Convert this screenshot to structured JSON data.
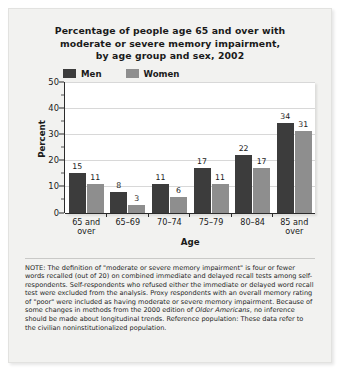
{
  "title": {
    "line1": "Percentage of people age 65 and over with",
    "line2": "moderate or severe memory impairment,",
    "line3": "by age group and sex, 2002"
  },
  "legend": {
    "men_label": "Men",
    "women_label": "Women",
    "men_color": "#3c3c3c",
    "women_color": "#8e8e8e"
  },
  "axes": {
    "ylabel": "Percent",
    "xlabel": "Age",
    "yticks": [
      "0",
      "10",
      "20",
      "30",
      "40",
      "50"
    ]
  },
  "note": {
    "part1": "NOTE: The definition of \"moderate or severe memory impairment\" is four or fewer words recalled (out of 20) on combined immediate and delayed recall tests among self-respondents. Self-respondents who refused either the immediate or delayed word recall test were excluded from the analysis. Proxy respondents with an overall memory rating of \"poor\" were included as having moderate or severe memory impairment. Because of some changes in methods from the 2000 edition of ",
    "italic": "Older Americans",
    "part2": ", no inference should be made about longitudinal trends. Reference population: These data refer to the civilian noninstitutionalized population."
  },
  "chart_data": {
    "type": "bar",
    "title": "Percentage of people age 65 and over with moderate or severe memory impairment, by age group and sex, 2002",
    "xlabel": "Age",
    "ylabel": "Percent",
    "ylim": [
      0,
      50
    ],
    "ytick_interval": 10,
    "grid": true,
    "legend_position": "top-left",
    "categories": [
      "65 and over",
      "65–69",
      "70–74",
      "75–79",
      "80–84",
      "85 and over"
    ],
    "series": [
      {
        "name": "Men",
        "color": "#3c3c3c",
        "values": [
          15,
          8,
          11,
          17,
          22,
          34
        ]
      },
      {
        "name": "Women",
        "color": "#8e8e8e",
        "values": [
          11,
          3,
          6,
          11,
          17,
          31
        ]
      }
    ]
  }
}
